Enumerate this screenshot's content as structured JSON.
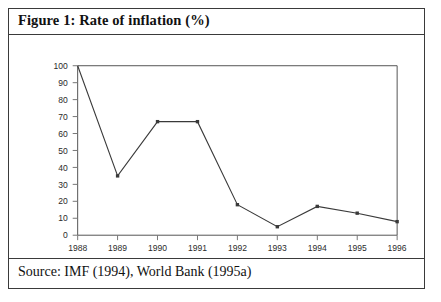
{
  "figure": {
    "title": "Figure 1: Rate of inflation (%)",
    "source": "Source: IMF (1994), World Bank (1995a)"
  },
  "chart_data": {
    "type": "line",
    "title": "Figure 1: Rate of inflation (%)",
    "xlabel": "",
    "ylabel": "",
    "x": [
      1988,
      1989,
      1990,
      1991,
      1992,
      1993,
      1994,
      1995,
      1996
    ],
    "categories": [
      "1988",
      "1989",
      "1990",
      "1991",
      "1992",
      "1993",
      "1994",
      "1995",
      "1996"
    ],
    "values": [
      100,
      35,
      67,
      67,
      18,
      5,
      17,
      13,
      8
    ],
    "series": [
      {
        "name": "Rate of inflation (%)",
        "values": [
          100,
          35,
          67,
          67,
          18,
          5,
          17,
          13,
          8
        ]
      }
    ],
    "xlim": [
      1988,
      1996
    ],
    "ylim": [
      0,
      100
    ],
    "ytick_labels": [
      "100",
      "90",
      "80",
      "70",
      "60",
      "50",
      "40",
      "30",
      "20",
      "10",
      "0"
    ],
    "yticks": [
      100,
      90,
      80,
      70,
      60,
      50,
      40,
      30,
      20,
      10,
      0
    ],
    "xtick_labels": [
      "1988",
      "1989",
      "1990",
      "1991",
      "1992",
      "1993",
      "1994",
      "1995",
      "1996"
    ],
    "grid": false,
    "legend": "none",
    "marker": "square",
    "line_color": "#3a3a3a",
    "axis_color": "#555555",
    "note": "1988 value is clipped at the top of the plot area (at or above 100)"
  }
}
